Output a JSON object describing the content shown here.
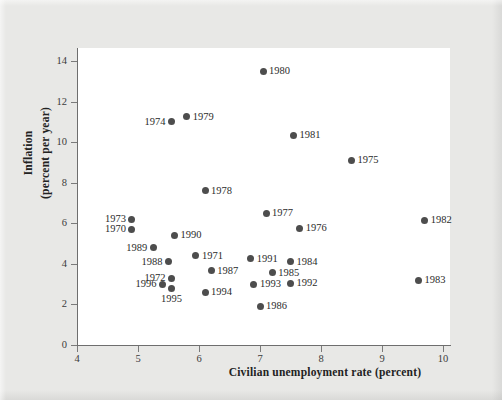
{
  "figure": {
    "background_color": "#e8e8e6",
    "plot_background_color": "#ffffff",
    "marker_color": "#4d4d4d",
    "axis_color": "#6e6e6e"
  },
  "chart_data": {
    "type": "scatter",
    "title": "",
    "xlabel": "Civilian unemployment rate (percent)",
    "ylabel_line1": "Inflation",
    "ylabel_line2": "(percent per year)",
    "ylabel": "Inflation (percent per year)",
    "xlim": [
      4,
      10.2
    ],
    "ylim": [
      0,
      15
    ],
    "xticks": [
      4,
      5,
      6,
      7,
      8,
      9,
      10
    ],
    "yticks": [
      0,
      2,
      4,
      6,
      8,
      10,
      12,
      14
    ],
    "grid": false,
    "legend": null,
    "points": [
      {
        "label": "1970",
        "x": 4.9,
        "y": 5.7,
        "pos": "left"
      },
      {
        "label": "1971",
        "x": 5.95,
        "y": 4.4,
        "pos": "right"
      },
      {
        "label": "1972",
        "x": 5.55,
        "y": 3.3,
        "pos": "left"
      },
      {
        "label": "1973",
        "x": 4.9,
        "y": 6.2,
        "pos": "left"
      },
      {
        "label": "1974",
        "x": 5.55,
        "y": 11.0,
        "pos": "left"
      },
      {
        "label": "1975",
        "x": 8.5,
        "y": 9.1,
        "pos": "right"
      },
      {
        "label": "1976",
        "x": 7.65,
        "y": 5.75,
        "pos": "right"
      },
      {
        "label": "1977",
        "x": 7.1,
        "y": 6.5,
        "pos": "right"
      },
      {
        "label": "1978",
        "x": 6.1,
        "y": 7.6,
        "pos": "right"
      },
      {
        "label": "1979",
        "x": 5.8,
        "y": 11.25,
        "pos": "right"
      },
      {
        "label": "1980",
        "x": 7.05,
        "y": 13.5,
        "pos": "right"
      },
      {
        "label": "1981",
        "x": 7.55,
        "y": 10.35,
        "pos": "right"
      },
      {
        "label": "1982",
        "x": 9.7,
        "y": 6.15,
        "pos": "right"
      },
      {
        "label": "1983",
        "x": 9.6,
        "y": 3.2,
        "pos": "right"
      },
      {
        "label": "1984",
        "x": 7.5,
        "y": 4.1,
        "pos": "right"
      },
      {
        "label": "1985",
        "x": 7.2,
        "y": 3.55,
        "pos": "right"
      },
      {
        "label": "1986",
        "x": 7.0,
        "y": 1.9,
        "pos": "right"
      },
      {
        "label": "1987",
        "x": 6.2,
        "y": 3.65,
        "pos": "right"
      },
      {
        "label": "1988",
        "x": 5.5,
        "y": 4.1,
        "pos": "left"
      },
      {
        "label": "1989",
        "x": 5.25,
        "y": 4.8,
        "pos": "left"
      },
      {
        "label": "1990",
        "x": 5.6,
        "y": 5.4,
        "pos": "right"
      },
      {
        "label": "1991",
        "x": 6.85,
        "y": 4.25,
        "pos": "right"
      },
      {
        "label": "1992",
        "x": 7.5,
        "y": 3.05,
        "pos": "right"
      },
      {
        "label": "1993",
        "x": 6.9,
        "y": 3.0,
        "pos": "right"
      },
      {
        "label": "1994",
        "x": 6.1,
        "y": 2.6,
        "pos": "right"
      },
      {
        "label": "1995",
        "x": 5.55,
        "y": 2.8,
        "pos": "below"
      },
      {
        "label": "1996",
        "x": 5.4,
        "y": 3.0,
        "pos": "left"
      }
    ]
  }
}
